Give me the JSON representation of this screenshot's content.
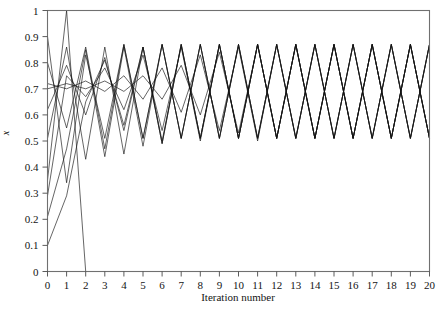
{
  "figure": {
    "background": "#ffffff",
    "line_color": "#121212",
    "frame_color": "#707070"
  },
  "axes": {
    "x_title": "Iteration number",
    "y_title": "x",
    "x_ticks": [
      "0",
      "1",
      "2",
      "3",
      "4",
      "5",
      "6",
      "7",
      "8",
      "9",
      "10",
      "11",
      "12",
      "13",
      "14",
      "15",
      "16",
      "17",
      "18",
      "19",
      "20"
    ],
    "y_ticks": [
      "0",
      "0.1",
      "0.2",
      "0.3",
      "0.4",
      "0.5",
      "0.6",
      "0.7",
      "0.8",
      "0.9",
      "1"
    ]
  },
  "chart_data": {
    "type": "line",
    "title": "",
    "subtitle": "",
    "xlabel": "Iteration number",
    "ylabel": "x",
    "xlim": [
      0,
      20
    ],
    "ylim": [
      0,
      1
    ],
    "xticks": [
      0,
      1,
      2,
      3,
      4,
      5,
      6,
      7,
      8,
      9,
      10,
      11,
      12,
      13,
      14,
      15,
      16,
      17,
      18,
      19,
      20
    ],
    "yticks": [
      0,
      0.1,
      0.2,
      0.3,
      0.4,
      0.5,
      0.6,
      0.7,
      0.8,
      0.9,
      1.0
    ],
    "grid": false,
    "legend": "none",
    "x": [
      0,
      1,
      2,
      3,
      4,
      5,
      6,
      7,
      8,
      9,
      10,
      11,
      12,
      13,
      14,
      15,
      16,
      17,
      18,
      19,
      20
    ],
    "annotations": [
      "Several trajectories of an iterated map started from different initial values",
      "All surviving trajectories settle into a period-2 oscillation between about 0.51 and 0.87",
      "One trajectory reaches 1.0 at iteration 1 and then collapses to 0 and stays there"
    ],
    "series": [
      {
        "name": "run-1",
        "values": [
          0.35,
          1.0,
          0.0,
          0.0,
          0.0,
          0.0,
          0.0,
          0.0,
          0.0,
          0.0,
          0.0,
          0.0,
          0.0,
          0.0,
          0.0,
          0.0,
          0.0,
          0.0,
          0.0,
          0.0,
          0.0
        ]
      },
      {
        "name": "run-2",
        "values": [
          0.9,
          0.34,
          0.83,
          0.51,
          0.87,
          0.51,
          0.87,
          0.51,
          0.87,
          0.51,
          0.87,
          0.51,
          0.87,
          0.51,
          0.87,
          0.51,
          0.87,
          0.51,
          0.87,
          0.51,
          0.87
        ]
      },
      {
        "name": "run-3",
        "values": [
          0.51,
          0.86,
          0.43,
          0.86,
          0.45,
          0.86,
          0.5,
          0.87,
          0.51,
          0.87,
          0.51,
          0.87,
          0.51,
          0.87,
          0.51,
          0.87,
          0.51,
          0.87,
          0.51,
          0.87,
          0.51
        ]
      },
      {
        "name": "run-4",
        "values": [
          0.62,
          0.79,
          0.6,
          0.82,
          0.54,
          0.86,
          0.49,
          0.87,
          0.51,
          0.87,
          0.51,
          0.87,
          0.51,
          0.87,
          0.51,
          0.87,
          0.51,
          0.87,
          0.51,
          0.87,
          0.51
        ]
      },
      {
        "name": "run-5",
        "values": [
          0.7,
          0.72,
          0.7,
          0.73,
          0.69,
          0.75,
          0.66,
          0.79,
          0.6,
          0.84,
          0.53,
          0.87,
          0.51,
          0.87,
          0.51,
          0.87,
          0.51,
          0.87,
          0.51,
          0.87,
          0.51
        ]
      },
      {
        "name": "run-6",
        "values": [
          0.72,
          0.7,
          0.73,
          0.69,
          0.75,
          0.66,
          0.78,
          0.61,
          0.83,
          0.54,
          0.86,
          0.5,
          0.87,
          0.51,
          0.87,
          0.51,
          0.87,
          0.51,
          0.87,
          0.51,
          0.87
        ]
      },
      {
        "name": "run-7",
        "values": [
          0.21,
          0.47,
          0.85,
          0.44,
          0.86,
          0.48,
          0.87,
          0.51,
          0.87,
          0.51,
          0.87,
          0.51,
          0.87,
          0.51,
          0.87,
          0.51,
          0.87,
          0.51,
          0.87,
          0.51,
          0.87
        ]
      },
      {
        "name": "run-8",
        "values": [
          0.1,
          0.29,
          0.65,
          0.81,
          0.56,
          0.86,
          0.49,
          0.87,
          0.51,
          0.87,
          0.51,
          0.87,
          0.51,
          0.87,
          0.51,
          0.87,
          0.51,
          0.87,
          0.51,
          0.87,
          0.51
        ]
      },
      {
        "name": "run-9",
        "values": [
          0.8,
          0.55,
          0.86,
          0.47,
          0.87,
          0.51,
          0.87,
          0.51,
          0.87,
          0.51,
          0.87,
          0.51,
          0.87,
          0.51,
          0.87,
          0.51,
          0.87,
          0.51,
          0.87,
          0.51,
          0.87
        ]
      },
      {
        "name": "run-10",
        "values": [
          0.29,
          0.75,
          0.67,
          0.78,
          0.62,
          0.83,
          0.54,
          0.86,
          0.5,
          0.87,
          0.51,
          0.87,
          0.51,
          0.87,
          0.51,
          0.87,
          0.51,
          0.87,
          0.51,
          0.87,
          0.51
        ]
      }
    ]
  }
}
